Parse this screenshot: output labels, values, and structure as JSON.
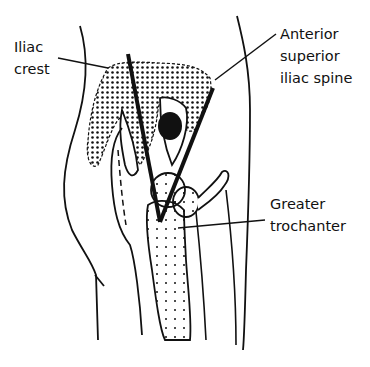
{
  "diagram": {
    "labels": {
      "iliac_crest": {
        "lines": [
          "Iliac",
          "crest"
        ]
      },
      "asis": {
        "lines": [
          "Anterior",
          "superior",
          "iliac spine"
        ]
      },
      "greater_trochanter": {
        "lines": [
          "Greater",
          "trochanter"
        ]
      }
    },
    "colors": {
      "ink": "#111111",
      "background": "#ffffff"
    }
  }
}
